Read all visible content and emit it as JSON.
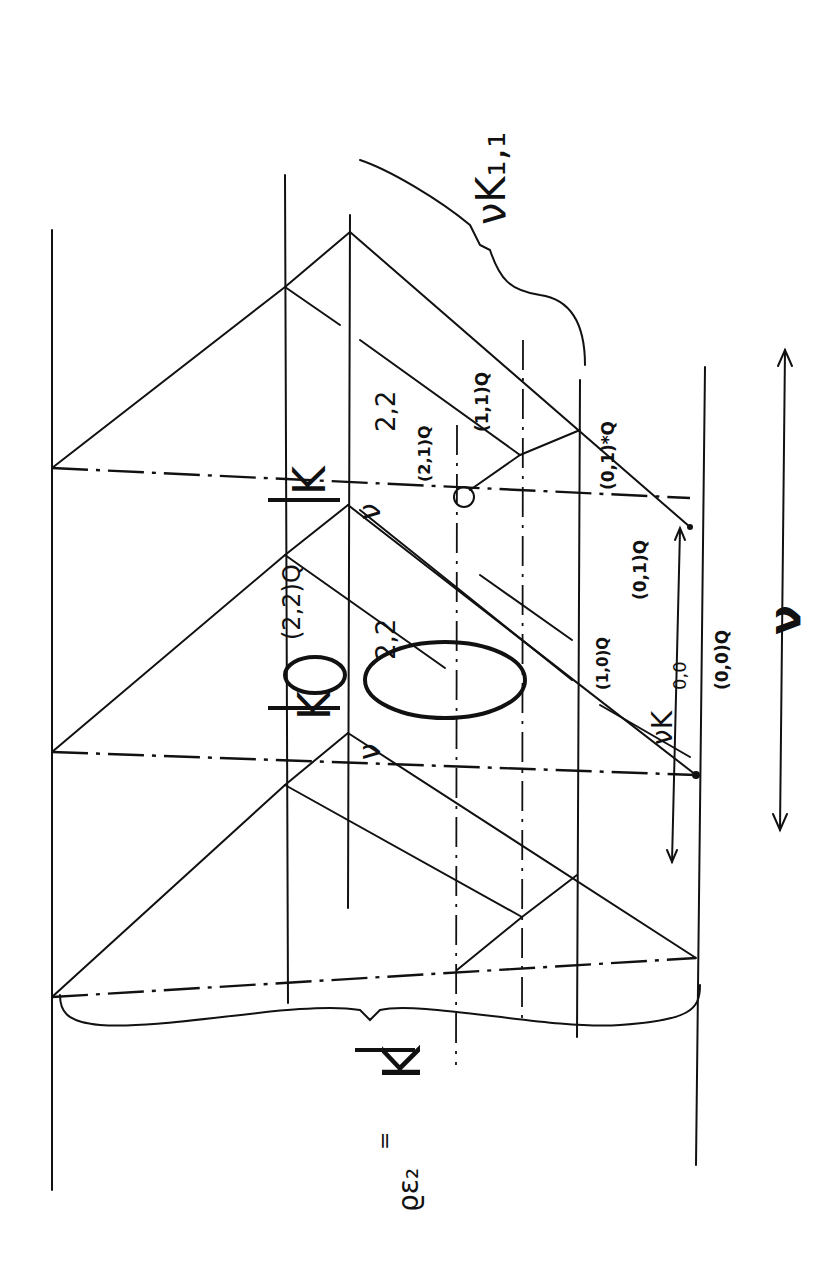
{
  "diagram": {
    "orientation": "rotated-90-clockwise",
    "labels": {
      "nu_K11": "νK₁,₁",
      "K22_top": "K",
      "K22_top_sub": "2,2",
      "K22_mid": "K",
      "K22_mid_sub": "2,2",
      "nu_K00": "νK",
      "nu_K00_sub": "0,0",
      "nu_axis": "ν",
      "K_bar": "K",
      "fraction": "=",
      "fraction_bottom": "ϱε₂",
      "q11": "(1,1)Q",
      "q01star": "(0,1)*Q",
      "q01": "(0,1)Q",
      "q00": "(0,0)Q",
      "q22": "(2,2)Q",
      "q21": "(2,1)Q",
      "q10": "(1,0)Q",
      "nu_top": "ν",
      "nu_bottom": "ν"
    },
    "line_color": "#111111",
    "background": "#ffffff"
  }
}
